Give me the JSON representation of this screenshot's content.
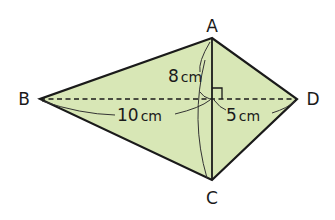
{
  "diagram": {
    "type": "kite quadrilateral with diagonals",
    "fill_color": "#d8e7b6",
    "stroke_color": "#1a1a1a",
    "vertices": {
      "A": {
        "label": "A",
        "x": 212,
        "y": 38
      },
      "B": {
        "label": "B",
        "x": 40,
        "y": 99
      },
      "C": {
        "label": "C",
        "x": 212,
        "y": 180
      },
      "D": {
        "label": "D",
        "x": 297,
        "y": 99
      }
    },
    "measurements": {
      "AO": {
        "value": "8",
        "unit": "cm"
      },
      "BO": {
        "value": "10",
        "unit": "cm"
      },
      "OD": {
        "value": "5",
        "unit": "cm"
      }
    },
    "right_angle_marker": true
  }
}
